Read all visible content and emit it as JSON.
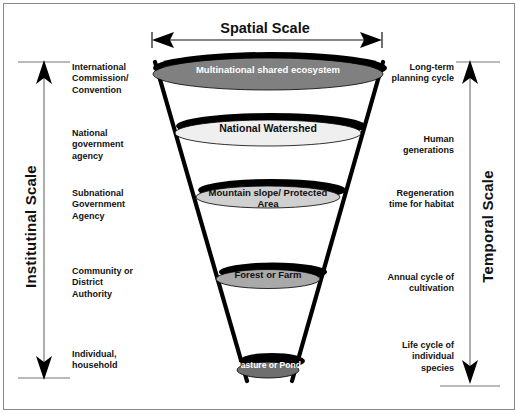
{
  "diagram": {
    "title_top": "Spatial Scale",
    "axis_left_title": "Institutinal Scale",
    "axis_right_title": "Temporal Scale",
    "left_axis_labels": [
      "International Commission/ Convention",
      "National government agency",
      "Subnational Government Agency",
      "Community or District Authority",
      "Individual, household"
    ],
    "right_axis_labels": [
      "Long-term planning cycle",
      "Human generations",
      "Regeneration time for habitat",
      "Annual cycle of cultivation",
      "Life cycle of individual species"
    ],
    "levels": [
      {
        "label": "Multinational shared ecosystem",
        "fill": "#808080",
        "text_color": "#ffffff"
      },
      {
        "label": "National Watershed",
        "fill": "#efefef",
        "text_color": "#111111"
      },
      {
        "label": "Mountain slope/ Protected Area",
        "fill": "#d0d0d0",
        "text_color": "#111111"
      },
      {
        "label": "Forest or Farm",
        "fill": "#a9a9a9",
        "text_color": "#111111"
      },
      {
        "label": "Pasture or Pond",
        "fill": "#6e6e6e",
        "text_color": "#ffffff"
      }
    ],
    "colors": {
      "shadow": "#000000",
      "funnel_line": "#000000",
      "border": "#8a8a8a",
      "background": "#ffffff"
    }
  }
}
